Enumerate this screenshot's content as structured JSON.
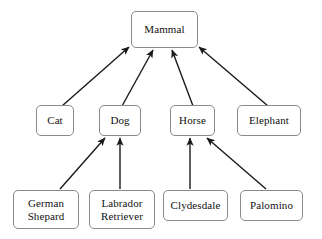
{
  "diagram": {
    "type": "hierarchy-taxonomy",
    "style": {
      "background": "#ffffff",
      "box_fill": "#ffffff",
      "box_border": "#8a8a8a",
      "edge_color": "#1a1a1a",
      "text_color": "#111111"
    },
    "nodes": [
      {
        "id": "mammal",
        "label": "Mammal",
        "level": 0,
        "x": 131,
        "y": 11,
        "w": 67,
        "h": 37
      },
      {
        "id": "cat",
        "label": "Cat",
        "level": 1,
        "x": 36,
        "y": 105,
        "w": 38,
        "h": 31
      },
      {
        "id": "dog",
        "label": "Dog",
        "level": 1,
        "x": 99,
        "y": 105,
        "w": 42,
        "h": 31
      },
      {
        "id": "horse",
        "label": "Horse",
        "level": 1,
        "x": 170,
        "y": 105,
        "w": 45,
        "h": 31
      },
      {
        "id": "elephant",
        "label": "Elephant",
        "level": 1,
        "x": 237,
        "y": 105,
        "w": 64,
        "h": 31
      },
      {
        "id": "german-shepard",
        "label": "German\nShepard",
        "level": 2,
        "x": 13,
        "y": 190,
        "w": 66,
        "h": 39
      },
      {
        "id": "labrador-retriever",
        "label": "Labrador\nRetriever",
        "level": 2,
        "x": 89,
        "y": 190,
        "w": 66,
        "h": 39
      },
      {
        "id": "clydesdale",
        "label": "Clydesdale",
        "level": 2,
        "x": 163,
        "y": 190,
        "w": 65,
        "h": 31
      },
      {
        "id": "palomino",
        "label": "Palomino",
        "level": 2,
        "x": 240,
        "y": 190,
        "w": 63,
        "h": 31
      }
    ],
    "edges": [
      {
        "id": "cat-to-mammal",
        "from": "cat",
        "to": "mammal",
        "x1": 62,
        "y1": 106,
        "x2": 129,
        "y2": 47
      },
      {
        "id": "dog-to-mammal",
        "from": "dog",
        "to": "mammal",
        "x1": 122,
        "y1": 106,
        "x2": 153,
        "y2": 50
      },
      {
        "id": "horse-to-mammal",
        "from": "horse",
        "to": "mammal",
        "x1": 193,
        "y1": 106,
        "x2": 172,
        "y2": 50
      },
      {
        "id": "elephant-to-mammal",
        "from": "elephant",
        "to": "mammal",
        "x1": 268,
        "y1": 106,
        "x2": 199,
        "y2": 47
      },
      {
        "id": "shepard-to-dog",
        "from": "german-shepard",
        "to": "dog",
        "x1": 60,
        "y1": 189,
        "x2": 105,
        "y2": 138
      },
      {
        "id": "labrador-to-dog",
        "from": "labrador-retriever",
        "to": "dog",
        "x1": 120,
        "y1": 189,
        "x2": 120,
        "y2": 138
      },
      {
        "id": "clydesdale-to-horse",
        "from": "clydesdale",
        "to": "horse",
        "x1": 190,
        "y1": 189,
        "x2": 190,
        "y2": 138
      },
      {
        "id": "palomino-to-horse",
        "from": "palomino",
        "to": "horse",
        "x1": 266,
        "y1": 189,
        "x2": 207,
        "y2": 138
      }
    ]
  }
}
